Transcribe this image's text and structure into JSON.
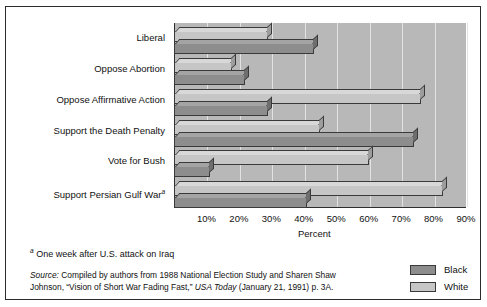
{
  "chart_data": {
    "type": "bar",
    "orientation": "horizontal",
    "grouped": true,
    "title": "",
    "xlabel": "Percent",
    "ylabel": "",
    "xlim": [
      0,
      90
    ],
    "xticks": [
      10,
      20,
      30,
      40,
      50,
      60,
      70,
      80,
      90
    ],
    "xtick_labels": [
      "10%",
      "20%",
      "30%",
      "40%",
      "50%",
      "60%",
      "70%",
      "80%",
      "90%"
    ],
    "grid": true,
    "grid_axis": "x",
    "legend_position": "bottom-right",
    "categories": [
      "Liberal",
      "Oppose Abortion",
      "Oppose Affirmative Action",
      "Support the Death Penalty",
      "Vote for Bush",
      "Support Persian Gulf War"
    ],
    "series": [
      {
        "name": "White",
        "color": "#c6c6c6",
        "values": [
          29,
          18,
          76,
          45,
          60,
          83
        ]
      },
      {
        "name": "Black",
        "color": "#8d8d8d",
        "values": [
          43,
          22,
          29,
          74,
          11,
          41
        ]
      }
    ]
  },
  "axis": {
    "xlabel": "Percent",
    "ticks": [
      "10%",
      "20%",
      "30%",
      "40%",
      "50%",
      "60%",
      "70%",
      "80%",
      "90%"
    ]
  },
  "categories": [
    {
      "label": "Liberal",
      "marker": ""
    },
    {
      "label": "Oppose Abortion",
      "marker": ""
    },
    {
      "label": "Oppose Affirmative Action",
      "marker": ""
    },
    {
      "label": "Support the Death Penalty",
      "marker": ""
    },
    {
      "label": "Vote for Bush",
      "marker": ""
    },
    {
      "label": "Support Persian Gulf War",
      "marker": "a"
    }
  ],
  "legend": {
    "items": [
      {
        "label": "Black",
        "color": "#8d8d8d"
      },
      {
        "label": "White",
        "color": "#c6c6c6"
      }
    ]
  },
  "notes": {
    "footnote_marker": "a",
    "footnote_text": "One week after U.S. attack on Iraq",
    "source_label": "Source:",
    "source_line1_a": " Compiled by authors from 1988 National Election Study and Sharen Shaw",
    "source_line2_a": "Johnson, “Vision of Short War Fading Fast,” ",
    "source_italic": "USA Today",
    "source_line2_b": " (January 21, 1991) p. 3A."
  }
}
